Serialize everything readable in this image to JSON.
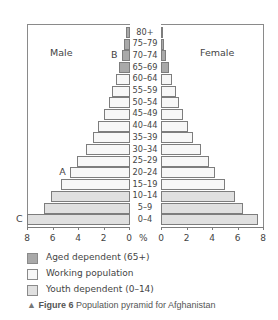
{
  "chart_data": {
    "type": "bar",
    "subtype": "population-pyramid",
    "title": "Figure 6 Population pyramid for Afghanistan",
    "figure_label": "Figure 6",
    "caption": "Population pyramid for Afghanistan",
    "xlabel": "%",
    "ylabel": "",
    "xlim": [
      0,
      8
    ],
    "x_ticks_left": [
      "8",
      "6",
      "4",
      "2",
      "0"
    ],
    "x_ticks_right": [
      "0",
      "2",
      "4",
      "6",
      "8"
    ],
    "categories": [
      "80+",
      "75–79",
      "70–74",
      "65–69",
      "60–64",
      "55–59",
      "50–54",
      "45–49",
      "40–44",
      "35–39",
      "30–34",
      "25–29",
      "20–24",
      "15–19",
      "10–14",
      "5–9",
      "0–4"
    ],
    "series": [
      {
        "name": "Male",
        "values": [
          0.2,
          0.4,
          0.55,
          0.8,
          1.0,
          1.3,
          1.6,
          2.0,
          2.4,
          2.8,
          3.4,
          4.1,
          4.6,
          5.3,
          6.1,
          6.7,
          8.0
        ]
      },
      {
        "name": "Female",
        "values": [
          0.1,
          0.2,
          0.4,
          0.6,
          0.85,
          1.2,
          1.4,
          1.7,
          2.1,
          2.5,
          3.1,
          3.8,
          4.2,
          5.0,
          5.8,
          6.4,
          7.6
        ]
      }
    ],
    "category_groups": [
      "aged",
      "aged",
      "aged",
      "aged",
      "working",
      "working",
      "working",
      "working",
      "working",
      "working",
      "working",
      "working",
      "working",
      "working",
      "youth",
      "youth",
      "youth"
    ],
    "legend": [
      {
        "key": "aged",
        "label": "Aged dependent (65+)",
        "color": "#a9a9a9"
      },
      {
        "key": "working",
        "label": "Working population",
        "color": "#f7f7f7"
      },
      {
        "key": "youth",
        "label": "Youth dependent (0–14)",
        "color": "#e0e0e0"
      }
    ],
    "annotations": [
      {
        "label": "A",
        "row": "20–24",
        "side": "Male"
      },
      {
        "label": "B",
        "row": "70–74",
        "side": "Male"
      },
      {
        "label": "C",
        "row": "0–4",
        "side": "Male"
      }
    ],
    "grid": false,
    "legend_position": "bottom-left"
  },
  "labels": {
    "male": "Male",
    "female": "Female",
    "percent": "%",
    "caption_marker": "▲",
    "caption_figure": "Figure 6",
    "caption_text": "Population pyramid for Afghanistan"
  }
}
